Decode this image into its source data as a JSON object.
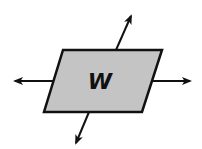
{
  "diagram": {
    "plane_label": "W",
    "colors": {
      "plane_fill": "#c4c4c4",
      "stroke": "#111111",
      "background": "#ffffff"
    },
    "plane": {
      "points": "63,50 162,50 142,112 44,112"
    },
    "arrows": [
      {
        "name": "arrow-up",
        "x1": 116,
        "y1": 50,
        "x2": 131,
        "y2": 16
      },
      {
        "name": "arrow-down",
        "x1": 89,
        "y1": 112,
        "x2": 76,
        "y2": 143
      },
      {
        "name": "arrow-left",
        "x1": 54,
        "y1": 81,
        "x2": 15,
        "y2": 81
      },
      {
        "name": "arrow-right",
        "x1": 152,
        "y1": 81,
        "x2": 190,
        "y2": 81
      }
    ]
  }
}
